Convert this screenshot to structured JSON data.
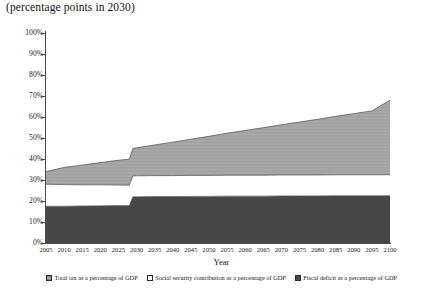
{
  "chart_data": {
    "type": "area",
    "title": "(percentage points in 2030)",
    "xlabel": "Year",
    "ylabel": "",
    "stacked": true,
    "grid": false,
    "legend_position": "bottom",
    "xlim": [
      2005,
      2100
    ],
    "ylim": [
      0,
      100
    ],
    "ytick_labels": [
      "0%",
      "10%",
      "20%",
      "30%",
      "40%",
      "50%",
      "60%",
      "70%",
      "80%",
      "90%",
      "100%"
    ],
    "ytick_values": [
      0,
      10,
      20,
      30,
      40,
      50,
      60,
      70,
      80,
      90,
      100
    ],
    "xtick_labels": [
      "2005",
      "2010",
      "2015",
      "2020",
      "2025",
      "2030",
      "2035",
      "2040",
      "2045",
      "2050",
      "2055",
      "2060",
      "2065",
      "2070",
      "2075",
      "2080",
      "2085",
      "2090",
      "2095",
      "2100"
    ],
    "xtick_values": [
      2005,
      2010,
      2015,
      2020,
      2025,
      2030,
      2035,
      2040,
      2045,
      2050,
      2055,
      2060,
      2065,
      2070,
      2075,
      2080,
      2085,
      2090,
      2095,
      2100
    ],
    "x": [
      2005,
      2010,
      2015,
      2020,
      2025,
      2028,
      2029,
      2030,
      2035,
      2040,
      2045,
      2050,
      2055,
      2060,
      2065,
      2070,
      2075,
      2080,
      2085,
      2090,
      2095,
      2100
    ],
    "series": [
      {
        "name": "Fiscal deficit as a percentage of GDP",
        "color": "#474747",
        "values": [
          17.5,
          17.5,
          17.6,
          17.7,
          17.8,
          17.8,
          22.0,
          22.0,
          22.1,
          22.1,
          22.2,
          22.2,
          22.3,
          22.3,
          22.3,
          22.4,
          22.4,
          22.4,
          22.5,
          22.5,
          22.5,
          22.5
        ]
      },
      {
        "name": "Social security contribution as a percentage of GDP",
        "color": "#ffffff",
        "values": [
          10.5,
          10.3,
          10.1,
          10.0,
          9.8,
          9.7,
          10.0,
          10.0,
          10.0,
          10.0,
          10.0,
          10.0,
          10.0,
          10.0,
          10.0,
          10.0,
          10.0,
          10.0,
          10.0,
          10.0,
          10.0,
          10.0
        ]
      },
      {
        "name": "Total tax as a percentage of GDP",
        "color": "#a8a8a8",
        "values": [
          6.0,
          8.2,
          9.4,
          10.6,
          11.8,
          12.4,
          13.0,
          13.3,
          14.6,
          15.9,
          17.2,
          18.6,
          20.0,
          21.3,
          22.6,
          23.9,
          25.2,
          26.5,
          27.8,
          29.1,
          30.4,
          35.5
        ]
      }
    ],
    "cumulative_top_boundary": [
      34.0,
      36.0,
      37.1,
      38.3,
      39.4,
      39.9,
      45.0,
      45.3,
      46.7,
      48.0,
      49.4,
      50.8,
      52.3,
      53.6,
      54.9,
      56.3,
      57.6,
      58.9,
      60.3,
      61.6,
      62.9,
      68.0
    ],
    "cumulative_mid_boundary": [
      28.0,
      27.8,
      27.7,
      27.7,
      27.6,
      27.5,
      32.0,
      32.0,
      32.1,
      32.1,
      32.2,
      32.2,
      32.3,
      32.3,
      32.3,
      32.4,
      32.4,
      32.4,
      32.5,
      32.5,
      32.5,
      32.5
    ]
  },
  "legend": {
    "items": [
      {
        "label": "Total tax as a percentage of GDP",
        "swatch": "hatch-gray-square-icon"
      },
      {
        "label": "Social security contribution as a percentage of GDP",
        "swatch": "white-square-icon"
      },
      {
        "label": "Fiscal deficit as a percentage of GDP",
        "swatch": "dark-square-icon"
      }
    ]
  }
}
